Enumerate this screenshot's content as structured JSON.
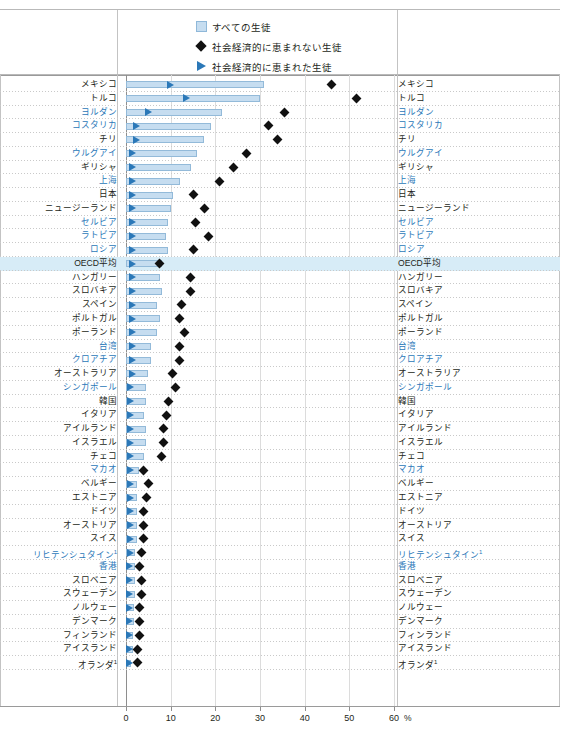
{
  "header": {
    "cropped_text": "————————————————————————"
  },
  "legend": {
    "items": [
      {
        "icon": "square-swatch-icon",
        "label": "すべての生徒"
      },
      {
        "icon": "diamond-marker-icon",
        "label": "社会経済的に恵まれない生徒"
      },
      {
        "icon": "triangle-marker-icon",
        "label": "社会経済的に恵まれた生徒"
      }
    ]
  },
  "colors": {
    "bar_fill": "#c6ddf0",
    "bar_stroke": "#93bad9",
    "triangle": "#2b78b8",
    "diamond": "#111111",
    "highlight_row": "#d7ecf7",
    "blue_label": "#2b78b8"
  },
  "chart_data": {
    "type": "bar",
    "title": "",
    "xlabel": "%",
    "ylabel": "",
    "xlim": [
      0,
      62
    ],
    "xticks": [
      0,
      10,
      20,
      30,
      40,
      50,
      60
    ],
    "xtick_labels": [
      "0",
      "10",
      "20",
      "30",
      "40",
      "50",
      "60"
    ],
    "unit_suffix": "%",
    "grid": true,
    "legend_position": "top-center",
    "series": [
      {
        "name": "すべての生徒",
        "type": "bar"
      },
      {
        "name": "社会経済的に恵まれない生徒",
        "type": "diamond"
      },
      {
        "name": "社会経済的に恵まれた生徒",
        "type": "triangle"
      }
    ],
    "rows": [
      {
        "label": "メキシコ",
        "blue": false,
        "highlight": false,
        "all": 31.0,
        "disadv": 46.0,
        "adv": 10.0
      },
      {
        "label": "トルコ",
        "blue": false,
        "highlight": false,
        "all": 30.0,
        "disadv": 51.5,
        "adv": 13.5
      },
      {
        "label": "ヨルダン",
        "blue": true,
        "highlight": false,
        "all": 21.5,
        "disadv": 35.5,
        "adv": 5.0
      },
      {
        "label": "コスタリカ",
        "blue": true,
        "highlight": false,
        "all": 19.0,
        "disadv": 32.0,
        "adv": 2.5
      },
      {
        "label": "チリ",
        "blue": false,
        "highlight": false,
        "all": 17.5,
        "disadv": 34.0,
        "adv": 2.5
      },
      {
        "label": "ウルグアイ",
        "blue": true,
        "highlight": false,
        "all": 16.0,
        "disadv": 27.0,
        "adv": 1.5
      },
      {
        "label": "ギリシャ",
        "blue": false,
        "highlight": false,
        "all": 14.5,
        "disadv": 24.0,
        "adv": 1.5
      },
      {
        "label": "上海",
        "blue": true,
        "highlight": false,
        "all": 12.0,
        "disadv": 21.0,
        "adv": 1.5
      },
      {
        "label": "日本",
        "blue": false,
        "highlight": false,
        "all": 10.5,
        "disadv": 15.0,
        "adv": 1.5
      },
      {
        "label": "ニュージーランド",
        "blue": false,
        "highlight": false,
        "all": 10.0,
        "disadv": 17.5,
        "adv": 1.5
      },
      {
        "label": "セルビア",
        "blue": true,
        "highlight": false,
        "all": 9.5,
        "disadv": 15.5,
        "adv": 1.5
      },
      {
        "label": "ラトビア",
        "blue": true,
        "highlight": false,
        "all": 9.0,
        "disadv": 18.5,
        "adv": 1.5
      },
      {
        "label": "ロシア",
        "blue": true,
        "highlight": false,
        "all": 9.5,
        "disadv": 15.0,
        "adv": 1.5
      },
      {
        "label": "OECD平均",
        "blue": false,
        "highlight": true,
        "all": 8.0,
        "disadv": 7.5,
        "adv": 1.5
      },
      {
        "label": "ハンガリー",
        "blue": false,
        "highlight": false,
        "all": 7.5,
        "disadv": 14.5,
        "adv": 1.5
      },
      {
        "label": "スロバキア",
        "blue": false,
        "highlight": false,
        "all": 8.0,
        "disadv": 14.5,
        "adv": 1.5
      },
      {
        "label": "スペイン",
        "blue": false,
        "highlight": false,
        "all": 7.0,
        "disadv": 12.5,
        "adv": 1.5
      },
      {
        "label": "ポルトガル",
        "blue": false,
        "highlight": false,
        "all": 7.5,
        "disadv": 12.0,
        "adv": 1.5
      },
      {
        "label": "ポーランド",
        "blue": false,
        "highlight": false,
        "all": 7.0,
        "disadv": 13.0,
        "adv": 1.5
      },
      {
        "label": "台湾",
        "blue": true,
        "highlight": false,
        "all": 5.5,
        "disadv": 12.0,
        "adv": 1.5
      },
      {
        "label": "クロアチア",
        "blue": true,
        "highlight": false,
        "all": 5.5,
        "disadv": 12.0,
        "adv": 1.5
      },
      {
        "label": "オーストラリア",
        "blue": false,
        "highlight": false,
        "all": 5.0,
        "disadv": 10.5,
        "adv": 1.5
      },
      {
        "label": "シンガポール",
        "blue": true,
        "highlight": false,
        "all": 4.5,
        "disadv": 11.0,
        "adv": 1.0
      },
      {
        "label": "韓国",
        "blue": false,
        "highlight": false,
        "all": 4.5,
        "disadv": 9.5,
        "adv": 1.0
      },
      {
        "label": "イタリア",
        "blue": false,
        "highlight": false,
        "all": 4.0,
        "disadv": 9.0,
        "adv": 1.0
      },
      {
        "label": "アイルランド",
        "blue": false,
        "highlight": false,
        "all": 4.5,
        "disadv": 8.5,
        "adv": 1.0
      },
      {
        "label": "イスラエル",
        "blue": false,
        "highlight": false,
        "all": 4.5,
        "disadv": 8.5,
        "adv": 1.0
      },
      {
        "label": "チェコ",
        "blue": false,
        "highlight": false,
        "all": 4.0,
        "disadv": 8.0,
        "adv": 1.0
      },
      {
        "label": "マカオ",
        "blue": true,
        "highlight": false,
        "all": 3.0,
        "disadv": 4.0,
        "adv": 1.0
      },
      {
        "label": "ベルギー",
        "blue": false,
        "highlight": false,
        "all": 2.5,
        "disadv": 5.0,
        "adv": 1.0
      },
      {
        "label": "エストニア",
        "blue": false,
        "highlight": false,
        "all": 2.5,
        "disadv": 4.5,
        "adv": 1.0
      },
      {
        "label": "ドイツ",
        "blue": false,
        "highlight": false,
        "all": 2.5,
        "disadv": 4.0,
        "adv": 1.0
      },
      {
        "label": "オーストリア",
        "blue": false,
        "highlight": false,
        "all": 2.5,
        "disadv": 4.0,
        "adv": 1.0
      },
      {
        "label": "スイス",
        "blue": false,
        "highlight": false,
        "all": 2.5,
        "disadv": 4.0,
        "adv": 1.0
      },
      {
        "label": "リヒテンシュタイン",
        "note": "1",
        "blue": true,
        "highlight": false,
        "all": 2.0,
        "disadv": 3.5,
        "adv": 1.0
      },
      {
        "label": "香港",
        "blue": true,
        "highlight": false,
        "all": 2.0,
        "disadv": 3.0,
        "adv": 0.8
      },
      {
        "label": "スロベニア",
        "blue": false,
        "highlight": false,
        "all": 2.0,
        "disadv": 3.5,
        "adv": 0.8
      },
      {
        "label": "スウェーデン",
        "blue": false,
        "highlight": false,
        "all": 2.0,
        "disadv": 3.5,
        "adv": 0.8
      },
      {
        "label": "ノルウェー",
        "blue": false,
        "highlight": false,
        "all": 1.8,
        "disadv": 3.0,
        "adv": 0.8
      },
      {
        "label": "デンマーク",
        "blue": false,
        "highlight": false,
        "all": 1.8,
        "disadv": 3.0,
        "adv": 0.8
      },
      {
        "label": "フィンランド",
        "blue": false,
        "highlight": false,
        "all": 1.5,
        "disadv": 3.0,
        "adv": 0.8
      },
      {
        "label": "アイスランド",
        "blue": false,
        "highlight": false,
        "all": 1.5,
        "disadv": 2.5,
        "adv": 0.8
      },
      {
        "label": "オランダ",
        "note": "1",
        "blue": false,
        "highlight": false,
        "all": 1.2,
        "disadv": 2.5,
        "adv": 0.8
      }
    ]
  }
}
